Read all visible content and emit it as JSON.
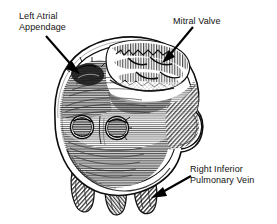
{
  "figure": {
    "type": "anatomical-illustration",
    "background_color": "#ffffff",
    "ink_color": "#111111",
    "shading_color": "#4a4a4a"
  },
  "labels": {
    "left_atrial_appendage": {
      "line1": "Left Atrial",
      "line2": "Appendage",
      "text": "Left Atrial\nAppendage"
    },
    "mitral_valve": {
      "line1": "Mitral Valve",
      "text": "Mitral Valve"
    },
    "right_inferior_pulmonary_vein": {
      "line1": "Right Inferior",
      "line2": "Pulmonary Vein",
      "text": "Right Inferior\nPulmonary Vein"
    }
  },
  "annotations": [
    {
      "name": "leader-arrow-left-atrial-appendage",
      "from_x": 46,
      "from_y": 36,
      "to_x": 79,
      "to_y": 73,
      "points_to": "left atrial appendage orifice"
    },
    {
      "name": "leader-arrow-mitral-valve",
      "from_x": 193,
      "from_y": 27,
      "to_x": 162,
      "to_y": 63,
      "points_to": "mitral valve leaflets"
    },
    {
      "name": "leader-arrow-right-inferior-pulmonary-vein",
      "from_x": 191,
      "from_y": 176,
      "to_x": 151,
      "to_y": 198,
      "points_to": "right inferior pulmonary vein stump"
    }
  ],
  "structures": {
    "atrial_wall_rim": "thick double-contour cut edge of atrial wall",
    "mitral_valve_leaflets": "textured folded leaflets across upper chamber",
    "pulmonary_vein_ostia": [
      {
        "name": "left-ostium",
        "cx": 82,
        "cy": 127,
        "r": 11
      },
      {
        "name": "right-ostium",
        "cx": 117,
        "cy": 128,
        "r": 11
      }
    ],
    "vein_stumps": [
      {
        "name": "vein-stump-left",
        "cx": 85
      },
      {
        "name": "vein-stump-middle",
        "cx": 117
      },
      {
        "name": "vein-stump-right",
        "cx": 146
      }
    ]
  }
}
